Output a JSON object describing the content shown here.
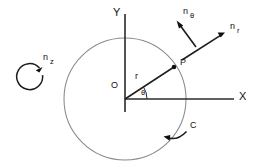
{
  "figure": {
    "background_color": "#ffffff",
    "stroke_color": "#1c1c1c",
    "circle_color": "#8a8a8a",
    "width": 261,
    "height": 168
  },
  "axes": {
    "x_label": "X",
    "y_label": "Y",
    "origin_label": "O",
    "origin": {
      "x": 125,
      "y": 99
    },
    "x_axis_end": {
      "x": 234,
      "y": 99
    },
    "y_axis_top": {
      "x": 125,
      "y": 14
    },
    "y_axis_bottom": {
      "x": 125,
      "y": 112
    }
  },
  "circle": {
    "label": "C",
    "center": {
      "x": 125,
      "y": 99
    },
    "radius": 61
  },
  "point": {
    "label": "P",
    "x": 174,
    "y": 67,
    "radius_label": "r",
    "angle_label": "θ",
    "angle_degrees": 33
  },
  "vectors": [
    {
      "name": "n-theta",
      "base": "n",
      "subscript": "θ",
      "tail": {
        "x": 196,
        "y": 47
      },
      "tip": {
        "x": 177,
        "y": 21
      },
      "label_x": 186,
      "label_y": 13
    },
    {
      "name": "n-r",
      "base": "n",
      "subscript": "r",
      "tail": {
        "x": 182,
        "y": 60
      },
      "tip": {
        "x": 224,
        "y": 33
      },
      "label_x": 233,
      "label_y": 27
    }
  ],
  "spin": {
    "name": "n-z",
    "base": "n",
    "subscript": "z",
    "center": {
      "x": 33,
      "y": 79
    },
    "radius": 13,
    "label_x": 46,
    "label_y": 58
  },
  "curve_pointer": {
    "label": "C",
    "label_x": 192,
    "label_y": 126,
    "tip": {
      "x": 164,
      "y": 138
    },
    "tail": {
      "x": 186,
      "y": 133
    }
  }
}
